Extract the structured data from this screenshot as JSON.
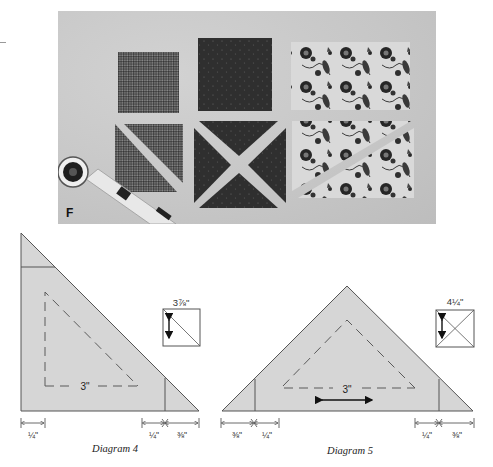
{
  "photo": {
    "label": "F",
    "description": "Fabric squares cut into half-square and quarter-square triangles beside a rotary cutter",
    "pieces": [
      {
        "name": "gingham-square",
        "pattern": "gingham"
      },
      {
        "name": "dark-dotted-square",
        "pattern": "dark-dot"
      },
      {
        "name": "floral-rectangle",
        "pattern": "floral"
      },
      {
        "name": "gingham-half-square-triangles",
        "pattern": "gingham"
      },
      {
        "name": "dark-quarter-square-triangles",
        "pattern": "dark-dot"
      },
      {
        "name": "floral-cut-triangles",
        "pattern": "floral"
      }
    ]
  },
  "diagrams": [
    {
      "id": "diagram-4",
      "caption": "Diagram 4",
      "finished_size": "3\"",
      "cut_square_size": "3⅞\"",
      "dimensions": {
        "left_seam": "¼\"",
        "right_seam": "¼\"",
        "right_tip": "⅜\""
      }
    },
    {
      "id": "diagram-5",
      "caption": "Diagram 5",
      "finished_size": "3\"",
      "cut_square_size": "4¼\"",
      "dimensions": {
        "left_tip": "⅜\"",
        "left_seam": "¼\"",
        "right_seam": "¼\"",
        "right_tip": "⅜\""
      }
    }
  ],
  "colors": {
    "triangle_fill": "#d6d6d6",
    "line": "#555555",
    "dash": "#5a5a5a",
    "photo_bg": "#c9c9c9"
  }
}
